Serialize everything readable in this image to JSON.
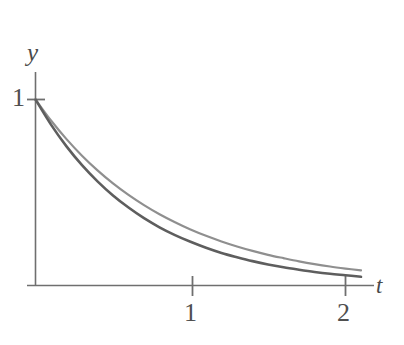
{
  "figure": {
    "background_color": "#ffffff",
    "axis_color": "#6b6b6b",
    "width": 404,
    "height": 345
  },
  "labels": {
    "y_axis": "y",
    "x_axis": "t",
    "y_tick_1": "1",
    "x_tick_1": "1",
    "x_tick_2": "2"
  },
  "chart_data": {
    "type": "line",
    "title": "",
    "subtitle": "",
    "xlabel": "t",
    "ylabel": "y",
    "xlim": [
      0,
      2.2
    ],
    "ylim": [
      0,
      1.1
    ],
    "xticks": [
      1,
      2
    ],
    "xticklabels": [
      "1",
      "2"
    ],
    "yticks": [
      1
    ],
    "yticklabels": [
      "1"
    ],
    "grid": false,
    "legend": false,
    "legend_position": "none",
    "annotations": [],
    "x": [
      0,
      0.1,
      0.2,
      0.3,
      0.4,
      0.5,
      0.6,
      0.7,
      0.8,
      0.9,
      1.0,
      1.1,
      1.2,
      1.3,
      1.4,
      1.5,
      1.6,
      1.7,
      1.8,
      1.9,
      2.0,
      2.1
    ],
    "series": [
      {
        "name": "upper-curve",
        "color": "#8f8f8f",
        "linewidth": 2.2,
        "description": "slower exponential decay, lies above",
        "values": [
          1.0,
          0.887,
          0.787,
          0.698,
          0.619,
          0.549,
          0.487,
          0.432,
          0.383,
          0.34,
          0.301,
          0.267,
          0.237,
          0.21,
          0.186,
          0.165,
          0.147,
          0.13,
          0.115,
          0.102,
          0.091,
          0.081
        ]
      },
      {
        "name": "lower-curve",
        "color": "#5e5e5e",
        "linewidth": 2.6,
        "description": "faster exponential decay, lies below",
        "values": [
          1.0,
          0.865,
          0.748,
          0.647,
          0.56,
          0.484,
          0.419,
          0.362,
          0.313,
          0.271,
          0.235,
          0.203,
          0.175,
          0.152,
          0.131,
          0.113,
          0.098,
          0.085,
          0.073,
          0.063,
          0.055,
          0.047
        ]
      }
    ]
  }
}
